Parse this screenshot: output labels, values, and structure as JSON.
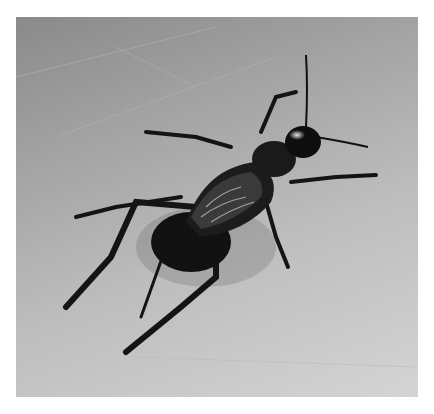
{
  "image": {
    "subject": "black cricket on a light gray surface",
    "palette": {
      "background_top": "#8a8a8a",
      "background_bottom": "#d4d4d4",
      "insect": "#141414",
      "highlight": "#cfcfcf"
    }
  }
}
